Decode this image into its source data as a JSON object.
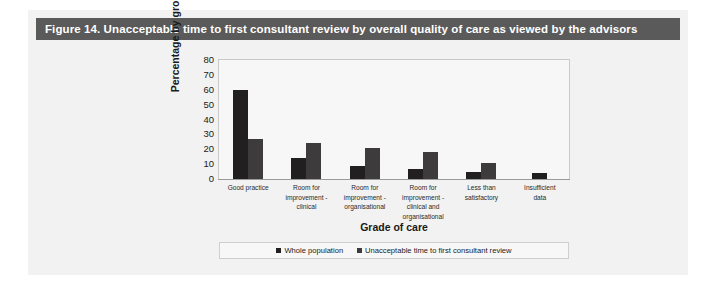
{
  "figure": {
    "caption": "Figure 14. Unacceptable time to first consultant review by overall quality of care as viewed by the advisors",
    "caption_bar_color": "#5a5a5a",
    "panel_background": "#f2f2f2"
  },
  "chart_data": {
    "type": "bar",
    "title": "Figure 14. Unacceptable time to first consultant review by overall quality of care as viewed by the advisors",
    "xlabel": "Grade of care",
    "ylabel": "Percentage by group",
    "ylim": [
      0,
      80
    ],
    "yticks": [
      80,
      70,
      60,
      50,
      40,
      30,
      20,
      10,
      0
    ],
    "grid": false,
    "legend_position": "bottom",
    "categories": [
      "Good practice",
      "Room for improvement - clinical",
      "Room for improvement - organisational",
      "Room for improvement - clinical and organisational",
      "Less than satisfactory",
      "Insufficient data"
    ],
    "category_lines": [
      [
        "Good practice"
      ],
      [
        "Room for",
        "improvement -",
        "clinical"
      ],
      [
        "Room for",
        "improvement -",
        "organisational"
      ],
      [
        "Room for",
        "improvement -",
        "clinical and",
        "organisational"
      ],
      [
        "Less than",
        "satisfactory"
      ],
      [
        "Insufficient",
        "data"
      ]
    ],
    "series": [
      {
        "name": "Whole population",
        "color": "#211f20",
        "values": [
          60,
          14,
          9,
          7,
          5,
          4
        ]
      },
      {
        "name": "Unacceptable time to first consultant review",
        "color": "#3d3b3c",
        "values": [
          27,
          24,
          21,
          18,
          11,
          0
        ]
      }
    ]
  }
}
